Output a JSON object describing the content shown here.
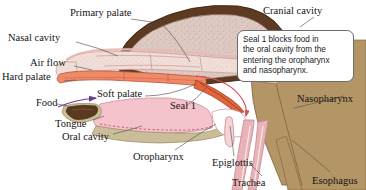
{
  "figure": {
    "background_color": "#ffffff"
  },
  "callout": {
    "text": "Seal 1 blocks food in\nthe oral cavity from the\nentering the oropharynx\nand nasopharynx.",
    "border_color": "#6c6c6c",
    "fill_color": "#ffffff"
  },
  "labels": [
    {
      "id": "primary-palate",
      "text": "Primary palate",
      "x": 70,
      "y": 8
    },
    {
      "id": "cranial-cavity",
      "text": "Cranial cavity",
      "x": 263,
      "y": 6
    },
    {
      "id": "nasal-cavity",
      "text": "Nasal cavity",
      "x": 8,
      "y": 33
    },
    {
      "id": "air-flow",
      "text": "Air flow",
      "x": 30,
      "y": 58
    },
    {
      "id": "hard-palate",
      "text": "Hard palate",
      "x": 2,
      "y": 72
    },
    {
      "id": "soft-palate",
      "text": "Soft palate",
      "x": 97,
      "y": 89
    },
    {
      "id": "seal-1",
      "text": "Seal 1",
      "x": 170,
      "y": 101
    },
    {
      "id": "food",
      "text": "Food",
      "x": 36,
      "y": 98
    },
    {
      "id": "tongue",
      "text": "Tongue",
      "x": 55,
      "y": 119
    },
    {
      "id": "oral-cavity",
      "text": "Oral cavity",
      "x": 62,
      "y": 132
    },
    {
      "id": "oropharynx",
      "text": "Oropharynx",
      "x": 133,
      "y": 152
    },
    {
      "id": "epiglottis",
      "text": "Epiglottis",
      "x": 212,
      "y": 158
    },
    {
      "id": "trachea",
      "text": "Trachea",
      "x": 232,
      "y": 178
    },
    {
      "id": "nasopharynx",
      "text": "Nasopharynx",
      "x": 297,
      "y": 94
    },
    {
      "id": "esophagus",
      "text": "Esophagus",
      "x": 312,
      "y": 176
    }
  ],
  "colors": {
    "skull_bone": "#5d3a22",
    "cranial_fill": "#ddc9c2",
    "nasal_lining": "#e9b9b4",
    "nasal_cavity_fill": "#f0ddd8",
    "hard_palate": "#ef8a68",
    "soft_palate": "#e2643a",
    "oral_tissue_pink": "#f4c3cc",
    "neck_tissue": "#b49566",
    "tongue_dark": "#5a3a1e",
    "tongue_edge": "#cbbd99",
    "trachea_wall": "#eab3b8",
    "food_arrow": "#6b3f96",
    "airflow_arrow": "#d4505e",
    "leader_line": "#555555",
    "text": "#141414"
  },
  "structures": [
    {
      "id": "cranial-cavity-mass",
      "name": "cranial cavity"
    },
    {
      "id": "nasal-cavity-passage",
      "name": "nasal cavity"
    },
    {
      "id": "hard-palate-band",
      "name": "hard palate"
    },
    {
      "id": "soft-palate-flap",
      "name": "soft palate"
    },
    {
      "id": "tongue-body",
      "name": "tongue"
    },
    {
      "id": "oral-cavity-space",
      "name": "oral cavity"
    },
    {
      "id": "oropharynx-space",
      "name": "oropharynx"
    },
    {
      "id": "nasopharynx-space",
      "name": "nasopharynx"
    },
    {
      "id": "epiglottis-flap",
      "name": "epiglottis"
    },
    {
      "id": "trachea-tube",
      "name": "trachea"
    },
    {
      "id": "esophagus-tube",
      "name": "esophagus"
    },
    {
      "id": "food-bolus",
      "name": "food bolus"
    }
  ]
}
